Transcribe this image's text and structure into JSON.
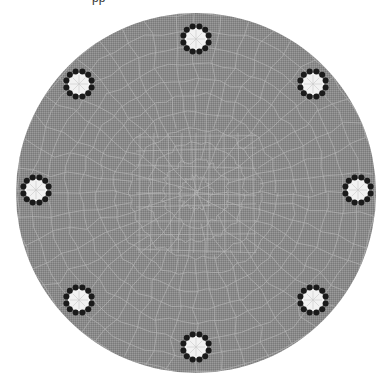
{
  "caption_fragment": "pp",
  "figure": {
    "type": "mesh-diagram",
    "width": 391,
    "height": 377,
    "background": "#ffffff",
    "domain": {
      "shape": "circle",
      "cx": 196,
      "cy": 193,
      "r": 180,
      "fill": "#8c8c8c",
      "mesh_line_color": "#b8b8b8",
      "mesh_rings": 11,
      "mesh_spokes": 44
    },
    "electrodes": {
      "count": 8,
      "ring_radius": 13,
      "dot_count": 12,
      "dot_radius": 3,
      "dot_color": "#1a1a1a",
      "core_radius": 10,
      "core_color": "#f2f2f2",
      "items": [
        {
          "id": "E1",
          "cx": 196,
          "cy": 39
        },
        {
          "id": "E2",
          "cx": 313,
          "cy": 84
        },
        {
          "id": "E3",
          "cx": 358,
          "cy": 190
        },
        {
          "id": "E4",
          "cx": 313,
          "cy": 300
        },
        {
          "id": "E5",
          "cx": 196,
          "cy": 347
        },
        {
          "id": "E6",
          "cx": 79,
          "cy": 300
        },
        {
          "id": "E7",
          "cx": 36,
          "cy": 190
        },
        {
          "id": "E8",
          "cx": 79,
          "cy": 84
        }
      ]
    }
  }
}
